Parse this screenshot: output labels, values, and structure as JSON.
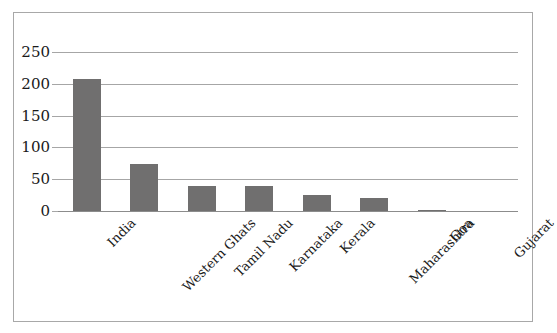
{
  "chart_data": {
    "type": "bar",
    "title": "",
    "subtitle": "",
    "xlabel": "",
    "ylabel": "",
    "categories": [
      "India",
      "Western Ghats",
      "Tamil Nadu",
      "Karnataka",
      "Kerala",
      "Maharashtra",
      "Goa",
      "Gujarat"
    ],
    "values": [
      207,
      74,
      40,
      39,
      25,
      20,
      2,
      0
    ],
    "ylim": [
      0,
      250
    ],
    "yticks": [
      0,
      50,
      100,
      150,
      200,
      250
    ],
    "ytick_labels": [
      "0",
      "50",
      "100",
      "150",
      "200",
      "250"
    ],
    "grid": true,
    "grid_axis": "y",
    "legend": false,
    "legend_position": "none",
    "bar_color": "#706F6F",
    "gridline_color": "#A6A6A6",
    "frame_color": "#A8A8A8",
    "background_color": "#FFFFFF",
    "text_color": "#1A1A1A",
    "xtick_rotation": -45
  }
}
